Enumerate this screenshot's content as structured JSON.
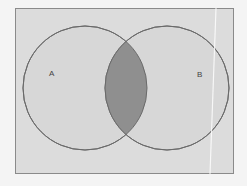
{
  "diagram": {
    "type": "venn",
    "sets": [
      {
        "label": "A",
        "cx": 85,
        "cy": 88,
        "r": 62
      },
      {
        "label": "B",
        "cx": 167,
        "cy": 88,
        "r": 62
      }
    ],
    "colors": {
      "background": "#dcdcdc",
      "circle_fill": "#d6d6d6",
      "circle_stroke": "#666666",
      "intersection_fill": "#8f8f8f",
      "frame_stroke": "#8a8a8a"
    },
    "highlighted_region": "A ∩ B"
  }
}
